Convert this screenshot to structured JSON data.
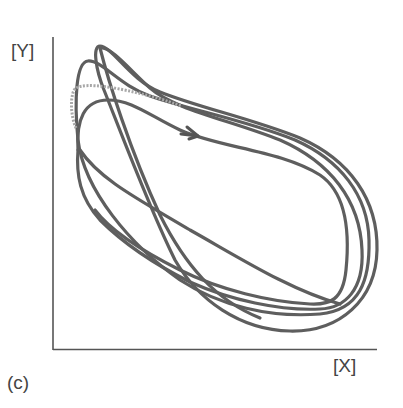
{
  "figure": {
    "panel_label": "(c)",
    "y_axis_label": "[Y]",
    "x_axis_label": "[X]"
  },
  "colors": {
    "curve": "#5e5e5e",
    "axis": "#555555",
    "dotted": "#a8a8a8",
    "text": "#444444"
  },
  "arrow": {
    "icon": "arrow-right-icon"
  }
}
